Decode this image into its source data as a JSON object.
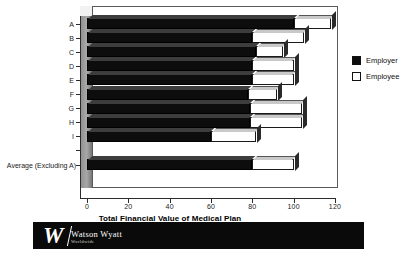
{
  "chart_data": {
    "type": "bar",
    "orientation": "horizontal",
    "stacked": true,
    "title": "",
    "xlabel": "Total Financial Value of Medical Plan",
    "ylabel": "",
    "xlim": [
      0,
      120
    ],
    "xticks": [
      0,
      20,
      40,
      60,
      80,
      100,
      120
    ],
    "xticklabels": [
      "0",
      "20",
      "40",
      "60",
      "80",
      "100",
      "120"
    ],
    "grid": false,
    "legend_position": "right",
    "categories": [
      "A",
      "B",
      "C",
      "D",
      "E",
      "F",
      "G",
      "H",
      "I",
      "",
      "Average (Excluding A)"
    ],
    "series": [
      {
        "name": "Employer",
        "color": "#0d0d0d",
        "values": [
          100,
          80,
          82,
          80,
          80,
          78,
          79,
          79,
          60,
          null,
          80
        ]
      },
      {
        "name": "Employee",
        "color": "#ffffff",
        "values": [
          18,
          25,
          13,
          20,
          20,
          14,
          25,
          25,
          22,
          null,
          20
        ]
      }
    ],
    "totals": [
      118,
      105,
      95,
      100,
      100,
      92,
      104,
      104,
      82,
      null,
      100
    ]
  },
  "legend": {
    "items": [
      {
        "label": "Employer",
        "swatch": "filled-black-square-icon"
      },
      {
        "label": "Employee",
        "swatch": "outlined-white-square-icon"
      }
    ]
  },
  "footer": {
    "logo_mark": "watson-wyatt-w-monogram-icon",
    "brand": "Watson Wyatt",
    "tagline": "Worldwide"
  }
}
